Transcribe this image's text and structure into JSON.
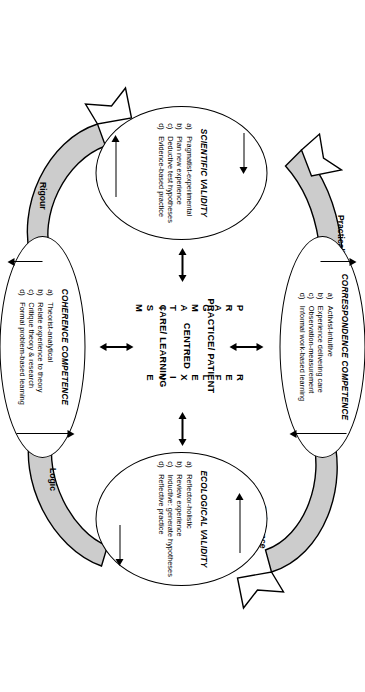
{
  "figure": {
    "centre": {
      "line1": "PRACTICE/ PATIENT",
      "line2": "CENTRED",
      "line3": "CARE/ LEARNING",
      "vertical_left": "PRAGMATISM",
      "vertical_right": "REFLEXIVE"
    },
    "nodes": [
      {
        "id": "correspondence-competence",
        "title": "CORRESPONDENCE COMPETENCE",
        "items": [
          {
            "bullet": "a)",
            "text": "Activist-intuitive"
          },
          {
            "bullet": "b)",
            "text": "Experience delivering care"
          },
          {
            "bullet": "c)",
            "text": "Observation-measurement"
          },
          {
            "bullet": "d)",
            "text": "Informal work-based learning"
          }
        ]
      },
      {
        "id": "scientific-validity",
        "title": "SCIENTIFIC VALIDITY",
        "items": [
          {
            "bullet": "a)",
            "text": "Pragmatist-experimental"
          },
          {
            "bullet": "b)",
            "text": "Plan new experience"
          },
          {
            "bullet": "c)",
            "text": "Deductive test hypotheses"
          },
          {
            "bullet": "d)",
            "text": "Evidence-based practice"
          }
        ]
      },
      {
        "id": "ecological-validity",
        "title": "ECOLOGICAL VALIDITY",
        "items": [
          {
            "bullet": "a)",
            "text": "Reflector-holistic"
          },
          {
            "bullet": "b)",
            "text": "Review experience"
          },
          {
            "bullet": "c)",
            "text": "Inductive: generate hypotheses"
          },
          {
            "bullet": "d)",
            "text": "Reflective practice"
          }
        ]
      },
      {
        "id": "coherence-competence",
        "title": "COHERENCE COMPETENCE",
        "items": [
          {
            "bullet": "a)",
            "text": "Theorist-analytical"
          },
          {
            "bullet": "b)",
            "text": "Relate experience to theory"
          },
          {
            "bullet": "c)",
            "text": "Critique theory & research"
          },
          {
            "bullet": "d)",
            "text": "Formal problem-based learning"
          }
        ]
      }
    ],
    "connectors": [
      {
        "id": "practicality",
        "label": "Practicality"
      },
      {
        "id": "relevance",
        "label": "Relevance"
      },
      {
        "id": "logic",
        "label": "Logic"
      },
      {
        "id": "rigour",
        "label": "Rigour"
      }
    ],
    "colors": {
      "stroke": "#000000",
      "swoosh_fill": "#cccccc",
      "background": "#ffffff"
    }
  }
}
